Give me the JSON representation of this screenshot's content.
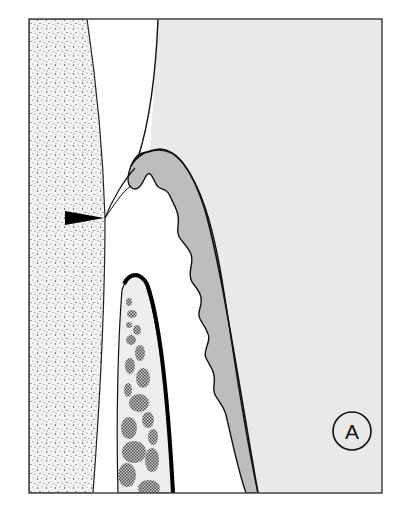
{
  "figure": {
    "panel_label": "A",
    "colors": {
      "background": "#ffffff",
      "frame": "#444444",
      "tooth_stipple_bg": "#f4f4f4",
      "stipple_dot": "#3a3a3a",
      "connective_tissue": "#e9e9e9",
      "epithelium": "#bdbdbd",
      "bone_fill": "#eeeeee",
      "marrow": "#6a6a6a",
      "outline": "#111111",
      "arrow": "#000000"
    },
    "regions": [
      {
        "name": "tooth-surface",
        "pattern": "stipple"
      },
      {
        "name": "sulcus-space",
        "pattern": "white"
      },
      {
        "name": "gingival-connective-tissue",
        "pattern": "light-gray"
      },
      {
        "name": "epithelium-band",
        "pattern": "mid-gray"
      },
      {
        "name": "alveolar-bone",
        "pattern": "cross-hatched marrow spaces"
      }
    ],
    "marker": {
      "type": "arrowhead",
      "direction": "right"
    }
  }
}
